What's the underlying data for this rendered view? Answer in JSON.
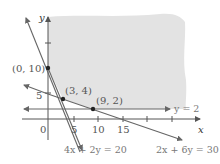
{
  "diagram": {
    "type": "linear-programming-feasible-region",
    "axes": {
      "x_label": "x",
      "y_label": "y",
      "origin_label": "0",
      "x_ticks": [
        "5",
        "10",
        "15"
      ],
      "y_ticks": [
        "5"
      ]
    },
    "points": [
      {
        "label": "(0, 10)",
        "x": 0,
        "y": 10
      },
      {
        "label": "(3, 4)",
        "x": 3,
        "y": 4
      },
      {
        "label": "(9, 2)",
        "x": 9,
        "y": 2
      }
    ],
    "lines": [
      {
        "label": "4x + 2y = 20"
      },
      {
        "label": "2x + 6y = 30"
      },
      {
        "label": "y = 2"
      }
    ],
    "colors": {
      "shaded_region": "#e3e3e3",
      "axis": "#555555",
      "line": "#666666",
      "point": "#222222",
      "label": "#666666"
    }
  }
}
